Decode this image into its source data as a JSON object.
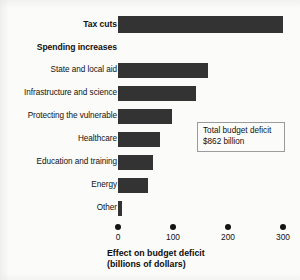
{
  "chart_data": {
    "type": "bar",
    "orientation": "horizontal",
    "title": "",
    "xlabel": "Effect on budget deficit (billions of dollars)",
    "ylabel": "",
    "xlim": [
      0,
      300
    ],
    "xticks": [
      "0",
      "100",
      "200",
      "300"
    ],
    "xtick_values": [
      0,
      100,
      200,
      300
    ],
    "grid": false,
    "legend": "none",
    "categories": [
      "Tax cuts",
      "State and local aid",
      "Infrastructure and science",
      "Protecting the vulnerable",
      "Healthcare",
      "Education and training",
      "Energy",
      "Other"
    ],
    "values": [
      300,
      163,
      142,
      98,
      76,
      64,
      55,
      8
    ],
    "section_headers": [
      {
        "label": "Spending increases",
        "before_category": "State and local aid"
      }
    ],
    "annotations": [
      {
        "line1": "Total budget deficit",
        "line2": "$862 billion"
      }
    ],
    "bar_color": "#333333",
    "background_color": "#fbfbfa",
    "text_color": "#111111"
  },
  "axis": {
    "title_line1": "Effect on budget deficit",
    "title_line2": "(billions of dollars)",
    "ticks": [
      {
        "label": "0"
      },
      {
        "label": "100"
      },
      {
        "label": "200"
      },
      {
        "label": "300"
      }
    ]
  },
  "rows": [
    {
      "label": "Tax cuts",
      "value": 300,
      "bold": true,
      "has_bar": true
    },
    {
      "label": "Spending increases",
      "value": null,
      "bold": true,
      "has_bar": false
    },
    {
      "label": "State and local aid",
      "value": 163,
      "bold": false,
      "has_bar": true
    },
    {
      "label": "Infrastructure and science",
      "value": 142,
      "bold": false,
      "has_bar": true
    },
    {
      "label": "Protecting the vulnerable",
      "value": 98,
      "bold": false,
      "has_bar": true
    },
    {
      "label": "Healthcare",
      "value": 76,
      "bold": false,
      "has_bar": true
    },
    {
      "label": "Education and training",
      "value": 64,
      "bold": false,
      "has_bar": true
    },
    {
      "label": "Energy",
      "value": 55,
      "bold": false,
      "has_bar": true
    },
    {
      "label": "Other",
      "value": 8,
      "bold": false,
      "has_bar": true
    }
  ],
  "annotation": {
    "line1": "Total budget deficit",
    "line2": "$862 billion"
  }
}
